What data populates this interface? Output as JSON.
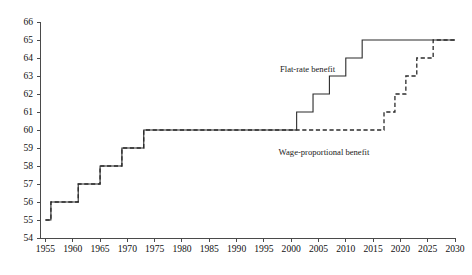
{
  "chart_data": {
    "type": "line",
    "title": "",
    "subtitle": "",
    "xlabel": "",
    "ylabel": "",
    "xlim": [
      1954,
      2030
    ],
    "ylim": [
      54,
      66
    ],
    "grid": false,
    "legend_position": "inline-annotations",
    "x_ticks": [
      1955,
      1960,
      1965,
      1970,
      1975,
      1980,
      1985,
      1990,
      1995,
      2000,
      2005,
      2010,
      2015,
      2020,
      2025,
      2030
    ],
    "x_tick_labels": [
      "1955",
      "1960",
      "1965",
      "1970",
      "1975",
      "1980",
      "1985",
      "1990",
      "1995",
      "2000",
      "2005",
      "2010",
      "2015",
      "2020",
      "2025",
      "2030"
    ],
    "y_ticks": [
      54,
      55,
      56,
      57,
      58,
      59,
      60,
      61,
      62,
      63,
      64,
      65,
      66
    ],
    "y_tick_labels": [
      "54",
      "55",
      "56",
      "57",
      "58",
      "59",
      "60",
      "61",
      "62",
      "63",
      "64",
      "65",
      "66"
    ],
    "series": [
      {
        "name": "Flat-rate benefit",
        "style": "solid",
        "annotation": "Flat-rate benefit",
        "annotation_x": 2003,
        "annotation_y": 63.2,
        "points": [
          [
            1955,
            55
          ],
          [
            1956,
            55
          ],
          [
            1956,
            56
          ],
          [
            1961,
            56
          ],
          [
            1961,
            57
          ],
          [
            1965,
            57
          ],
          [
            1965,
            58
          ],
          [
            1969,
            58
          ],
          [
            1969,
            59
          ],
          [
            1973,
            59
          ],
          [
            1973,
            60
          ],
          [
            2001,
            60
          ],
          [
            2001,
            61
          ],
          [
            2004,
            61
          ],
          [
            2004,
            62
          ],
          [
            2007,
            62
          ],
          [
            2007,
            63
          ],
          [
            2010,
            63
          ],
          [
            2010,
            64
          ],
          [
            2013,
            64
          ],
          [
            2013,
            65
          ],
          [
            2030,
            65
          ]
        ]
      },
      {
        "name": "Wage-proportional benefit",
        "style": "dashed",
        "annotation": "Wage-proportional benefit",
        "annotation_x": 2006,
        "annotation_y": 58.6,
        "points": [
          [
            1955,
            55
          ],
          [
            1956,
            55
          ],
          [
            1956,
            56
          ],
          [
            1961,
            56
          ],
          [
            1961,
            57
          ],
          [
            1965,
            57
          ],
          [
            1965,
            58
          ],
          [
            1969,
            58
          ],
          [
            1969,
            59
          ],
          [
            1973,
            59
          ],
          [
            1973,
            60
          ],
          [
            2017,
            60
          ],
          [
            2017,
            61
          ],
          [
            2019,
            61
          ],
          [
            2019,
            62
          ],
          [
            2021,
            62
          ],
          [
            2021,
            63
          ],
          [
            2023,
            63
          ],
          [
            2023,
            64
          ],
          [
            2026,
            64
          ],
          [
            2026,
            65
          ],
          [
            2030,
            65
          ]
        ]
      }
    ]
  },
  "axes_geometry": {
    "plot_left": 40,
    "plot_right": 455,
    "plot_top": 22,
    "plot_bottom": 238
  },
  "colors": {
    "axis": "#4a4a4a",
    "series": "#2b2b2b",
    "background": "#ffffff",
    "text": "#111111"
  }
}
